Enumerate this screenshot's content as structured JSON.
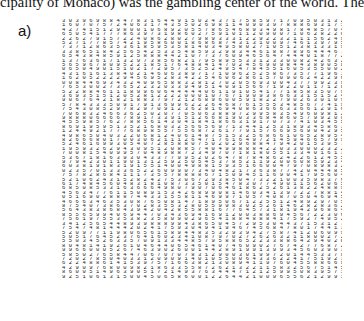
{
  "top_text": "cipality of Monaco) was the gambling center of the world. The",
  "panel_label": "a)",
  "digit_rows": [
    "3 0 3 9 6 9 8 8 4 4 7 8 3 1 6 4 4 9 1 5 0 2 4 3 7 1 7 5 8 5 9 7 1 7 0 9 5 0 3 1 3 2 2 4 4 7 1 5 8 0 0",
    "1 6 0 7 0 7 5 7 2 4 0 6 3 1 7 4 3 5 5 0 2 6 9 8 1 1 4 0 9 0 3 9 7 8 8 8 6 9 3 1 7 1 2 3 8 7 4 5 9 5",
    "4 2 7 4 1 5 1 2 9 8 0 0 1 0 6 8 9 2 0 5 5 7 8 6 5 4 6 8 9 3 4 9 8 1 7 8 4 8 5 7 0 4 1 2 2 7 1 3 1 0 7",
    "6 5 0 5 4 1 7 7 7 8 6 3 9 7 3 1 9 8 6 0 2 7 5 9 1 0 1 1 2 0 9 0 0 7 1 0 6 2 8 2 2 0 9 1 1 2 3 0 2 7",
    "2 2 6 2 7 9 1 5 7 2 2 4 0 8 6 2 8 0 2 7 9 8 9 3 3 3 1 2 2 9 2 2 3 2 1 1 1 5 6 2 4 9 8 9 4 0 8 2 3 3 1",
    "5 2 7 1 7 7 8 5 7 4 2 1 9 5 8 6 0 0 1 8 6 8 6 8 7 4 3 1 3 1 0 0 9 7 4 6 1 3 9 7 9 5 0 2 6 5 9 9 8 1 5 1 1",
    "7 3 7 1 2 8 6 3 5 3 6 1 8 5 9 5 3 5 8 1 4 0 3 4 9 5 8 0 2 7 1 0 5 1 2 3 8 1 3 3 1 9 7 5 1 8 3 9 6",
    "3 3 8 6 5 1 8 4 2 5 6 5 4 2 5 3 3 5 4 8 5 9 3 2 9 8 3 4 4 6 1 8 8 7 8 9 6 4 4 4 6 7 2 1 2 5 9 3 3",
    "6 5 4 3 8 4 8 5 9 1 2 5 8 8 8 4 4 2 1 0 7 7 3 7 6 0 9 4 6 5 6 4 7 4 4 4 0 1 8 7 7 2 2 3 3 4 2 1 2 8",
    "1 3 7 6 3 6 1 7 1 3 2 9 7 3 8 5 6 8 2 1 7 9 5 8 9 5 5 3 3 1 2 3 3 0 0 8 2 4 2 6 3 2 1 6 5 3 1 3 4 5",
    "5 6 5 9 6 7 8 0 9 5 2 2 1 8 5 1 7 6 4 8 8 4 1 4 7 0 2 4 5 6 9 0 9 8 4 4 3 8 9 0 5 8 2 0 5 1 3 6 7",
    "0 6 5 0 4 9 0 1 5 1 0 2 1 7 2 9 5 7 3 5 2 5 2 4 9 5 4 7 8 4 5 5 1 6 0 5 3 5 5 0 0 2 3 7 7 4 1 6 1",
    "4 3 1 6 1 6 1 3 8 4 0 2 1 4 6 0 6 3 8 9 7 1 7 1 0 9 6 2 5 2 5 8 6 7 3 5 7 7 1 9 6 3 7 9 8 7 0 9 3",
    "1 6 2 0 5 2 2 2 2 9 4 5 6 9 5 2 8 3 4 2 2 5 4 6 0 6 2 8 6 1 5 7 0 9 0 6 2 4 2 2 9 6 6 2 2 1 8 0",
    "0 0 8 4 4 6 9 3 4 3 2 4 0 9 6 5 8 8 3 2 8 1 2 7 0 2 0 5 6 9 3 0 0 4 3 7 7 9 9 2 3 9 3 2 8 2 5",
    "7 6 5 3 0 0 2 7 3 6 5 2 2 3 2 0 3 3 9 4 9 5 1 4 0 9 1 5 6 6 7 1 9 2 2 0 1 1 7 1 2 8 0 5 8 6",
    "5 2 2 8 8 4 6 1 1 1 8 9 9 6 0 6 4 4 4 4 4 0 6 1 1 9 1 0 5 4 1 7 7 1 8 5 8 3 5 0 7 9 7 7 6 1 8 4",
    "3 6 9 3 5 1 5 1 2 0 5 2 8 1 2 2 2 2 0 0 0 1 0 7 6 7 1 9 0 9 3 8 6 6 3 3 1 5 1 5 2 4 8 3 7 4 1 6 2",
    "9 0 6 7 6 4 2 1 8 2 1 8 8 3 7 9 7 2 1 2 6 8 9 6 0 0 5 9 1 8 2 2 7 9 0 2 6 3 0 1 0 9 4 5 0 7",
    "5 7 8 4 3 3 3 5 0 9 1 7 9 1 3 6 9 9 6 2 2 2 6 4 6 8 7 6 1 5 5 5 3 4 8 5 6 7 7 4 1 9 5 3 4 2 2",
    "7 5 4 3 0 8 5 2 9 7 8 2 9 7 0 9 1 2 3 6 2 8 1 6 9 4 0 8 6 3 6 6 6 3 3 6 6 1 2 9 1 6 6 1 7 7 3",
    "7 0 6 8 3 2 4 6 6 3 6 2 5 0 2 0 7 7 0 5 0 6 3 8 8 9 7 2 9 9 5 8 3 5 4 9 6 0 9 8 1 2 0 9 2 6 6 6",
    "9 8 8 8 0 6 6 6 6 7 8 9 1 7 3 3 9 1 5 1 2 6 6 8 1 9 0 3 3 6 8 4 8 6 0 5 7 9 9 2 0 8 6 0 8 8 2",
    "4 5 5 9 8 5 7 6 2 7 8 8 5 6 1 4 3 0 4 1 8 4 1 8 6 6 3 1 9 1 7 0 7 3 7 4 1 0 3 4 5 5 0 2 7 8 7 6",
    "8 6 9 1 9 5 9 5 1 3 5 2 1 6 8 0 3 2 5 6 6 5 6 9 7 1 3 4 4 1 2 5 3 1 8 9 3 4 5 8 6 3 8 7 5 6",
    "1 2 4 4 9 2 1 7 7 7 6 8 9 8 5 5 7 5 5 6 8 7 2 6 1 7 7 9 1 5 7 6 6 9 5 6 9 0 4 2 9 5 5 3",
    "4 9 8 6 5 0 4 0 3 2 2 0 6 8 1 2 4 0 6 1 4 8 7 5 1 5 3 2 5 6 8 6 6 1 0 6 5 2 8 9 5 4 2 2 2",
    "8 2 6 6 6 8 0 1 7 0 0 3 0 6 2 1 1 1 2 6 4 7 1 7 6 1 6 4 9 7 2 1 4 5 9 4 6 6 5 7 9 9 0 5 5",
    "5 2 4 6 1 6 9 9 3 0 5 4 0 7 2 8 5 8 8 0 7 5 0 2 0 2 9 6 8 8 4 7 9 4 2 0 1 5 3 9 5 7 1 2",
    "1 9 5 9 3 2 6 2 9 4 3 0 9 5 1 2 0 8 8 5 7 4 0 4 9 9 8 8 8 4 2 2 0 3 3 0 0 0 2 3 2 2 8 9 1 9",
    "7 0 0 8 1 5 4 0 9 9 5 7 0 4 8 9 8 8 7 2 3 4 9 7 0 7 1 8 1 8 0 5 5 1 3 3 4 0 1 6 1 3 7 3 7 2",
    "5 3 6 7 1 8 1 6 3 9 3 0 4 3 3 7 7 9 9 5 2 0 2 6 4 7 8 7 8 4 8 6 2 4 2 2 6 1 2 4 5 5 6 9",
    "9 7 9 4 2 3 0 1 1 9 0 1 3 1 2 5 9 2 5 0 5 4 5 3 7 8 5 2 1 1 9 2 0 0 6 0 8 5 9 2 3 4 5 7 4 5",
    "6 0 3 8 1 9 1 8 3 1 9 1 5 5 1 4 0 0 4 9 8 8 1 5 9 3 5 1 6 6 0 0 4 7 9 7 0 8 9 8 3 2 1 2 1 8",
    "0 2 3 5 7 0 1 3 3 3 6 5 2 2 6 0 9 9 0 7 3 4 0 4 8 2 1 7 3 6 3 8 7 7 4 2 0 4 4 4 8 5 3 5 0 6",
    "7 5 7 8 2 8 6 8 4 1 1 1 7 3 5 5 7 8 8 8 8 6 7 1 5 0 9 4 5 1 1 6 9 0 4 1 7 9 5 6 0 4 2 8 6 3",
    "5 2 1 0 6 2 4 3 1 5 2 8 2 4 2 7 5 3 0 6 7 2 9 3 8 5 0 4 7 3 2 2 1 0 0 3 5 9 8 3 7 6 5 4 3 6 3 0 6 3 5 3",
    "6 1 7 4 8 4 5 6 0 4 8 3 1 8 1 0 8 7 3 3 5 0 1 5 4 7 8 3 0 7 7 4 9 0 1 1 5 6 2 0 6 5 8 7 5 6 2 7",
    "6 8 5 0 8 5 3 3 1 6 3 6 6 6 4 9 8 0 7 9 0 7 0 6 4 6 1 8 6 2 5 2 6 1 3 8 2 2 4 8 8 9 7 6 5 9 7 5",
    "4 5 6 3 4 7 7 6 1 1 5 0 8 9 1 5 3 4 2 6 8 9 9 0 8 1 4 6 0 3 4 1 3 9 7 2 2 7 8 8 1 4 6 2 0 4 3",
    "0 5 1 6 9 0 2 8 8 8 7 4 4 3 3 1 5 5 8 1 1 4 6 9 9 7 1 0 5 7 4 0 8 7 0 5 0 4 6 9 4 5 0 7 7 3 6 8",
    "4 6 6 6 3 4 6 3 5 3 0 8 7 6 5 0 8 1 4 7 1 8 9 5 0 6 7 1 2 2 5 5 1 2 4 8 9 2 9 7 0 5 5 9",
    "8 7 5 4 0 7 3 8 6 3 7 0 2 8 3 5 5 3 2 8 0 5 5 9 9 8 3 0 2 5 2 6 1 4 6 2 8 2 8 3 6 2 8 4 7 3",
    "5 6 4 3 8 3 8 6 8 4 3 9 4 2 0 4 2 8 5 5 8 8 1 6 7 7 6 4 5 7 3 1 8 1 9 4 2 9 6 8 6 4 4 6 2 1 7",
    "8 5 5 6 5 9 9 4 0 6 9 4 4 7 0 3 4 3 6 9 4 1 6 9 1 2 0 0 3 8 8 6 9 4 5 6 7 2 2 3 0 6 2 1 0 6 1 1",
    "7 5 6 1 9 7 5 5 3 5 3 8 2 3 5 8 0 9 0 2 9 6 5 4 1 8 8 4 8 8 8 4 1 7 5 9 2 7 4 9 5 2 7 6",
    "3 4 1 2 5 6 5 4 4 8 9 3 9 8 8 8 9 9 4 3 8 6 5 0 4 5 7 2 9 5 3 0 4 4 3 7 1 5 3 1 2 7 1 5 6 1 2 0 0",
    "7 5 4 7 4 8 1 4 4 4 2 0 2 4 1 7 5 9 3 0 4 9 4 1 9 4 6 7 4 5 6 8 4 7 8 0 1 7 4 4 1 3 6 6 6 2 7",
    "5 2 0 9 7 7 1 1 9 8 0 6 5 6 1 5 8 9 4 4 8 3 5 3 2 9 3 9 4 2 7 5 8 7 4 1 2 0 6 0 9 9 6 9 2",
    "5 0 5 1 7 6 4 5 2 3 7 6 4 1 6 0 2 3 4 1 0 8 7 9 7 0 2 7 2 6 2 6 3 2 1 1 8 0 0 2 7 2 9 6 3 5",
    "5 5 0 3 4 5 2 6 3 3 5 7 0 9 1 3 3 4 4 8 5 7 9 5 8 8 6 5 2 2 3 3 8 8 6 4 2 9 4 0 2 0 5 9 0 2 9 6 8 5",
    "8 0 4 8 1 4 1 9 2 6 1 0 4 6 4 4 0 6 5 4 6 1 4 0 7 4 6 0 9 0 2 7 6 7 4 2 7 7 6 8 7 2 9 9 3 6 8 5 8 4",
    "9 9 6 6 0 0 0 5 2 6 7 4 6 3 9 0 2 6 0 0 1 4 4 2 8 9 1 9 9 1 3 9 9 3 4 5 6 0 3 9 0 3 6 2 3 3 5 8 0 9",
    "5 8 5 0 2 7 6 5 8 4 4 7 0 6 7 0 7 0 7 8 3 1 2 9 0 0 3 0 1 9 9 7 2 0 1 4 4 5 3 3 7 8 5 0 5 4 6 8 5 4",
    "7 2 0 2 7 8 5 0 4 0 3 3 1 2 0 9 0 9 1 4 0 1 0 5 5 0 0 6 4 3 3 6 2 2 4 1 7 5 1 9 2 3 4 7 3 6 4 3 6 6",
    "6 2 2 4 8 8 6 1 4 1 5 3 9 7 5 7 1 6 6 3 8 2 1 3 0 8 9 4 1 1 9 7 6 0 4 5 5 8 8 6 6 9 2 5 2 3 0 7 3 1",
    "4 2 9 0 9 7 6 8 0 0 9 8 2 1 8 6 3 3 5 5 8 7 2 6 2 1 3 2 2 1 1 5 8 3 2 5 6 7 5 1 4 5 0 4 4 3 5 6 4 5 8",
    "8 6 0 0 5 1 4 9 6 3 9 0 5 1 7 2 1 4 9 3 7 6 3 4 4 4 7 1 2 1 2 5 9 9 5 0 8 3 9 5 7 1 1 8 3 6 1 0 3 1",
    "9 2 5 1 0 6 1 3 1 5 0 0 4 5 0 6 5 8 6 0 0 1 2 2 6 4 4 2 1 0 0 9 6 5 5 6 2 1 2 9 9 1 2 3 5 9 8 6 5 4 6"
  ]
}
